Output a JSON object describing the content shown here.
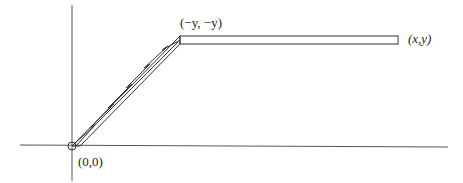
{
  "diagram": {
    "labels": {
      "origin": "(0,0)",
      "corner": "(−y, −y)",
      "endpoint": "(x,y)"
    },
    "colors": {
      "stroke": "#333333",
      "axis": "#555555",
      "background": "#ffffff"
    },
    "axes": {
      "horizontal": {
        "x1": 20,
        "y1": 145,
        "x2": 448,
        "y2": 147
      },
      "vertical": {
        "x1": 72,
        "y1": 5,
        "x2": 72,
        "y2": 181
      }
    },
    "origin_marker": {
      "cx": 72,
      "cy": 146,
      "r": 4
    },
    "path_segments": [
      {
        "name": "diagonal-strip",
        "from": "(0,0)",
        "to": "(−y, −y)"
      },
      {
        "name": "horizontal-strip",
        "from": "(−y, −y)",
        "to": "(x,y)"
      }
    ]
  }
}
